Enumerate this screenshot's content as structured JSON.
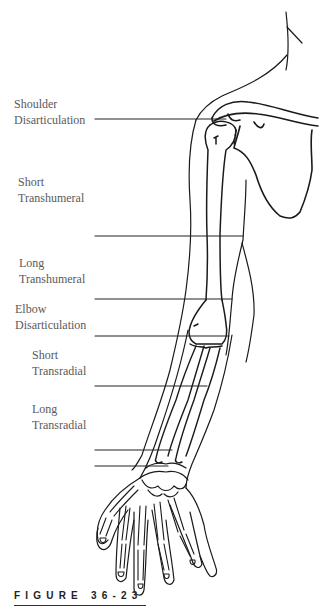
{
  "figure": {
    "caption": "FIGURE 36-23"
  },
  "levels": [
    {
      "line1": "Shoulder",
      "line2": "Disarticulation"
    },
    {
      "line1": "Short",
      "line2": "Transhumeral"
    },
    {
      "line1": "Long",
      "line2": "Transhumeral"
    },
    {
      "line1": "Elbow",
      "line2": "Disarticulation"
    },
    {
      "line1": "Short",
      "line2": "Transradial"
    },
    {
      "line1": "Long",
      "line2": "Transradial"
    }
  ]
}
